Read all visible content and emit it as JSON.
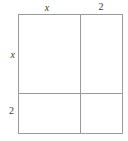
{
  "figure": {
    "kind": "area-model",
    "line_color": "#9a9a9a",
    "fill_color": "#ffffff",
    "text_color": "#3a3a3a"
  },
  "labels": {
    "top": {
      "left_segment": "x",
      "right_segment": "2"
    },
    "left": {
      "upper_segment": "x",
      "lower_segment": "2"
    }
  },
  "chart_data": {
    "type": "diagram",
    "title": "",
    "subtitle": "",
    "xlabel": "",
    "ylabel": "",
    "width_segments": [
      {
        "label": "x",
        "fraction": 0.59
      },
      {
        "label": "2",
        "fraction": 0.41
      }
    ],
    "height_segments": [
      {
        "label": "x",
        "fraction": 0.66
      },
      {
        "label": "2",
        "fraction": 0.34
      }
    ],
    "regions": [
      {
        "position": "top-left",
        "width_label": "x",
        "height_label": "x"
      },
      {
        "position": "top-right",
        "width_label": "2",
        "height_label": "x"
      },
      {
        "position": "bottom-left",
        "width_label": "x",
        "height_label": "2"
      },
      {
        "position": "bottom-right",
        "width_label": "2",
        "height_label": "2"
      }
    ],
    "grid": false,
    "legend": "none"
  }
}
